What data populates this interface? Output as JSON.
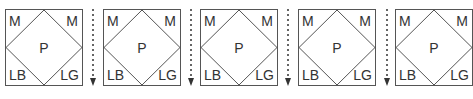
{
  "diagram": {
    "panels": [
      {
        "top_left": "M",
        "top_right": "M",
        "center": "P",
        "bottom_left": "LB",
        "bottom_right": "LG"
      },
      {
        "top_left": "M",
        "top_right": "M",
        "center": "P",
        "bottom_left": "LB",
        "bottom_right": "LG"
      },
      {
        "top_left": "M",
        "top_right": "M",
        "center": "P",
        "bottom_left": "LB",
        "bottom_right": "LG"
      },
      {
        "top_left": "M",
        "top_right": "M",
        "center": "P",
        "bottom_left": "LB",
        "bottom_right": "LG"
      },
      {
        "top_left": "M",
        "top_right": "M",
        "center": "P",
        "bottom_left": "LB",
        "bottom_right": "LG"
      }
    ],
    "separators": [
      {
        "icon": "dotted-down-arrow-icon"
      },
      {
        "icon": "dotted-down-arrow-icon"
      },
      {
        "icon": "dotted-down-arrow-icon"
      },
      {
        "icon": "dotted-down-arrow-icon"
      }
    ],
    "colors": {
      "stroke": "#555555",
      "text": "#333333",
      "background": "#ffffff"
    }
  }
}
